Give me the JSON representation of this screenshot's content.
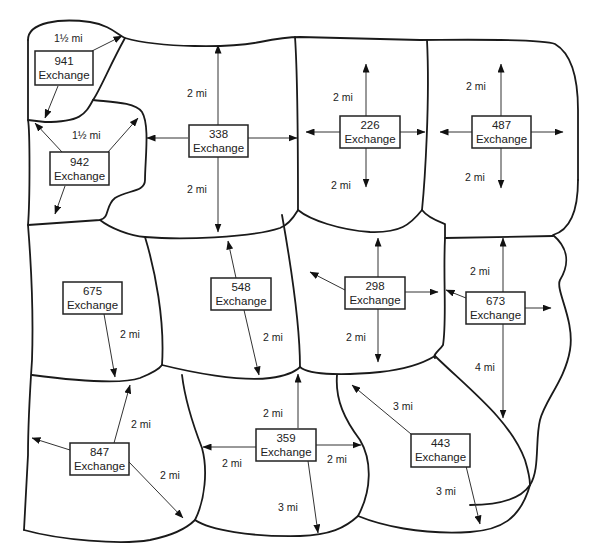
{
  "diagram": {
    "type": "telephone exchange service areas map",
    "exchange_suffix": "Exchange",
    "exchanges": [
      {
        "id": "941",
        "label": "941",
        "sub": "Exchange",
        "cx": 63,
        "cy": 68,
        "distances": [
          "1½ mi"
        ]
      },
      {
        "id": "942",
        "label": "942",
        "sub": "Exchange",
        "cx": 79,
        "cy": 168,
        "distances": [
          "1½ mi"
        ]
      },
      {
        "id": "338",
        "label": "338",
        "sub": "Exchange",
        "cx": 218,
        "cy": 141,
        "distances": [
          "2 mi",
          "2 mi"
        ]
      },
      {
        "id": "226",
        "label": "226",
        "sub": "Exchange",
        "cx": 366,
        "cy": 132,
        "distances": [
          "2 mi",
          "2 mi"
        ]
      },
      {
        "id": "487",
        "label": "487",
        "sub": "Exchange",
        "cx": 500,
        "cy": 132,
        "distances": [
          "2 mi",
          "2 mi"
        ]
      },
      {
        "id": "675",
        "label": "675",
        "sub": "Exchange",
        "cx": 93,
        "cy": 298,
        "distances": [
          "2 mi"
        ]
      },
      {
        "id": "548",
        "label": "548",
        "sub": "Exchange",
        "cx": 239,
        "cy": 294,
        "distances": [
          "2 mi"
        ]
      },
      {
        "id": "298",
        "label": "298",
        "sub": "Exchange",
        "cx": 374,
        "cy": 293,
        "distances": [
          "2 mi"
        ]
      },
      {
        "id": "673",
        "label": "673",
        "sub": "Exchange",
        "cx": 495,
        "cy": 308,
        "distances": [
          "2 mi",
          "4 mi"
        ]
      },
      {
        "id": "847",
        "label": "847",
        "sub": "Exchange",
        "cx": 99,
        "cy": 459,
        "distances": [
          "2 mi",
          "2 mi"
        ]
      },
      {
        "id": "359",
        "label": "359",
        "sub": "Exchange",
        "cx": 286,
        "cy": 444,
        "distances": [
          "2 mi",
          "2 mi",
          "2 mi",
          "3 mi"
        ]
      },
      {
        "id": "443",
        "label": "443",
        "sub": "Exchange",
        "cx": 440,
        "cy": 450,
        "distances": [
          "3 mi",
          "3 mi"
        ]
      }
    ],
    "distance_labels": [
      {
        "text": "1½ mi",
        "x": 54,
        "y": 42
      },
      {
        "text": "1½ mi",
        "x": 72,
        "y": 139
      },
      {
        "text": "2 mi",
        "x": 187,
        "y": 97
      },
      {
        "text": "2 mi",
        "x": 187,
        "y": 193
      },
      {
        "text": "2 mi",
        "x": 333,
        "y": 101
      },
      {
        "text": "2 mi",
        "x": 331,
        "y": 189
      },
      {
        "text": "2 mi",
        "x": 466,
        "y": 90
      },
      {
        "text": "2 mi",
        "x": 465,
        "y": 181
      },
      {
        "text": "2 mi",
        "x": 120,
        "y": 338
      },
      {
        "text": "2 mi",
        "x": 263,
        "y": 341
      },
      {
        "text": "2 mi",
        "x": 346,
        "y": 341
      },
      {
        "text": "2 mi",
        "x": 470,
        "y": 275
      },
      {
        "text": "4 mi",
        "x": 475,
        "y": 371
      },
      {
        "text": "2 mi",
        "x": 131,
        "y": 428
      },
      {
        "text": "2 mi",
        "x": 160,
        "y": 479
      },
      {
        "text": "2 mi",
        "x": 263,
        "y": 417
      },
      {
        "text": "2 mi",
        "x": 222,
        "y": 467
      },
      {
        "text": "2 mi",
        "x": 327,
        "y": 463
      },
      {
        "text": "3 mi",
        "x": 278,
        "y": 511
      },
      {
        "text": "3 mi",
        "x": 393,
        "y": 410
      },
      {
        "text": "3 mi",
        "x": 436,
        "y": 495
      }
    ]
  }
}
